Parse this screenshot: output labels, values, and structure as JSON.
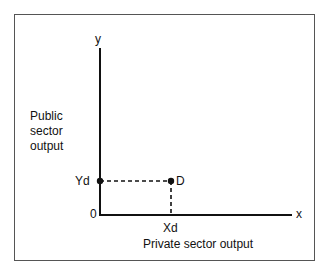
{
  "diagram": {
    "y_axis_label": "y",
    "x_axis_label": "x",
    "origin_label": "0",
    "y_title_lines": [
      "Public",
      "sector",
      "output"
    ],
    "x_title": "Private sector output",
    "point_label": "D",
    "y_tick_label": "Yd",
    "x_tick_label": "Xd"
  }
}
